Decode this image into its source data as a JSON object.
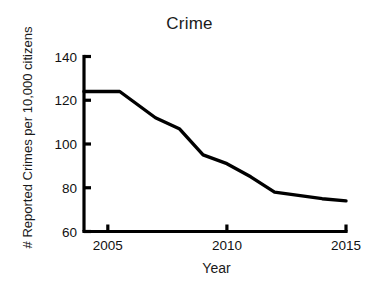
{
  "chart_data": {
    "type": "line",
    "title": "Crime",
    "xlabel": "Year",
    "ylabel": "# Reported Crimes per 10,000 citizens",
    "x": [
      2004,
      2005,
      2005.5,
      2006,
      2007,
      2008,
      2009,
      2010,
      2011,
      2012,
      2013,
      2014,
      2015
    ],
    "values": [
      124,
      124,
      124,
      120,
      112,
      107,
      95,
      91,
      85,
      78,
      76.5,
      75,
      74
    ],
    "series": [
      {
        "name": "Reported crimes",
        "values": [
          124,
          124,
          124,
          120,
          112,
          107,
          95,
          91,
          85,
          78,
          76.5,
          75,
          74
        ],
        "color": "#000000"
      }
    ],
    "xlim": [
      2004,
      2015
    ],
    "ylim": [
      60,
      140
    ],
    "xticks": [
      2005,
      2010,
      2015
    ],
    "xtick_labels": [
      "2005",
      "2010",
      "2015"
    ],
    "yticks": [
      60,
      80,
      100,
      120,
      140
    ],
    "ytick_labels": [
      "60",
      "80",
      "100",
      "120",
      "140"
    ],
    "grid": false,
    "legend": false,
    "legend_position": "none",
    "line_color": "#000000",
    "axis_color": "#000000",
    "background_color": "#ffffff"
  }
}
